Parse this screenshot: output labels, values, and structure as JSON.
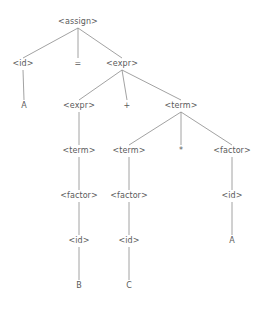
{
  "diagram": {
    "type": "parse-tree",
    "background_color": "#ffffff",
    "text_color": "#5a5a5a",
    "edge_color": "#8a8a8a",
    "grammar_expression": "A = B + C * A",
    "nodes": [
      {
        "id": "n0",
        "label": "<assign>",
        "kind": "nonterminal",
        "x": 78,
        "y": 22
      },
      {
        "id": "n1",
        "label": "<id>",
        "kind": "nonterminal",
        "x": 23,
        "y": 64
      },
      {
        "id": "n2",
        "label": "=",
        "kind": "terminal",
        "x": 78,
        "y": 64
      },
      {
        "id": "n3",
        "label": "<expr>",
        "kind": "nonterminal",
        "x": 122,
        "y": 64
      },
      {
        "id": "n4",
        "label": "A",
        "kind": "terminal",
        "x": 24,
        "y": 106
      },
      {
        "id": "n5",
        "label": "<expr>",
        "kind": "nonterminal",
        "x": 79,
        "y": 106
      },
      {
        "id": "n6",
        "label": "+",
        "kind": "terminal",
        "x": 127,
        "y": 106
      },
      {
        "id": "n7",
        "label": "<term>",
        "kind": "nonterminal",
        "x": 181,
        "y": 106
      },
      {
        "id": "n8",
        "label": "<term>",
        "kind": "nonterminal",
        "x": 79,
        "y": 151
      },
      {
        "id": "n9",
        "label": "<term>",
        "kind": "nonterminal",
        "x": 129,
        "y": 151
      },
      {
        "id": "n10",
        "label": "*",
        "kind": "terminal",
        "x": 181,
        "y": 151
      },
      {
        "id": "n11",
        "label": "<factor>",
        "kind": "nonterminal",
        "x": 232,
        "y": 151
      },
      {
        "id": "n12",
        "label": "<factor>",
        "kind": "nonterminal",
        "x": 79,
        "y": 196
      },
      {
        "id": "n13",
        "label": "<factor>",
        "kind": "nonterminal",
        "x": 129,
        "y": 196
      },
      {
        "id": "n14",
        "label": "<id>",
        "kind": "nonterminal",
        "x": 232,
        "y": 196
      },
      {
        "id": "n15",
        "label": "<id>",
        "kind": "nonterminal",
        "x": 79,
        "y": 241
      },
      {
        "id": "n16",
        "label": "<id>",
        "kind": "nonterminal",
        "x": 129,
        "y": 241
      },
      {
        "id": "n17",
        "label": "A",
        "kind": "terminal",
        "x": 232,
        "y": 241
      },
      {
        "id": "n18",
        "label": "B",
        "kind": "terminal",
        "x": 79,
        "y": 286
      },
      {
        "id": "n19",
        "label": "C",
        "kind": "terminal",
        "x": 129,
        "y": 286
      }
    ],
    "edges": [
      {
        "from": "n0",
        "to": "n1"
      },
      {
        "from": "n0",
        "to": "n2"
      },
      {
        "from": "n0",
        "to": "n3"
      },
      {
        "from": "n1",
        "to": "n4"
      },
      {
        "from": "n3",
        "to": "n5"
      },
      {
        "from": "n3",
        "to": "n6"
      },
      {
        "from": "n3",
        "to": "n7"
      },
      {
        "from": "n5",
        "to": "n8"
      },
      {
        "from": "n7",
        "to": "n9"
      },
      {
        "from": "n7",
        "to": "n10"
      },
      {
        "from": "n7",
        "to": "n11"
      },
      {
        "from": "n8",
        "to": "n12"
      },
      {
        "from": "n9",
        "to": "n13"
      },
      {
        "from": "n11",
        "to": "n14"
      },
      {
        "from": "n12",
        "to": "n15"
      },
      {
        "from": "n13",
        "to": "n16"
      },
      {
        "from": "n14",
        "to": "n17"
      },
      {
        "from": "n15",
        "to": "n18"
      },
      {
        "from": "n16",
        "to": "n19"
      }
    ]
  }
}
